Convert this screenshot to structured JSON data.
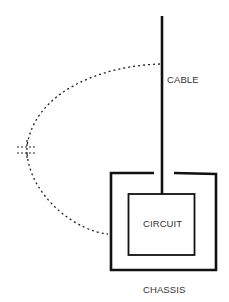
{
  "diagram": {
    "labels": {
      "cable": "CABLE",
      "circuit": "CIRCUIT",
      "chassis": "CHASSIS"
    },
    "elements": {
      "cable": "vertical-conductor",
      "chassis": "open-top-enclosure",
      "circuit": "inner-box",
      "coupling_path": "dotted-arc-with-capacitor-symbol"
    },
    "colors": {
      "line": "#111111",
      "text": "#333333",
      "background": "#ffffff"
    }
  }
}
